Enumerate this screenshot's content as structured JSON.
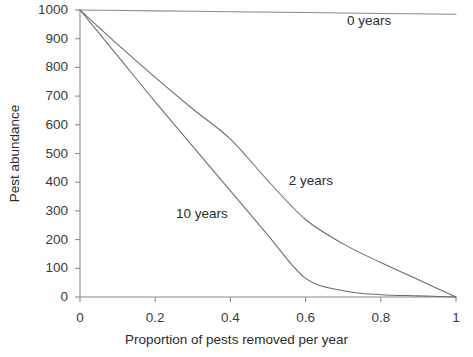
{
  "chart_data": {
    "type": "line",
    "title": "",
    "xlabel": "Proportion of pests removed per year",
    "ylabel": "Pest abundance",
    "xlim": [
      0,
      1
    ],
    "ylim": [
      0,
      1000
    ],
    "grid": false,
    "legend_position": "inline-annotations",
    "xticks": [
      "0",
      "0.2",
      "0.4",
      "0.6",
      "0.8",
      "1"
    ],
    "xtick_values": [
      0,
      0.2,
      0.4,
      0.6,
      0.8,
      1
    ],
    "yticks": [
      "0",
      "100",
      "200",
      "300",
      "400",
      "500",
      "600",
      "700",
      "800",
      "900",
      "1000"
    ],
    "ytick_values": [
      0,
      100,
      200,
      300,
      400,
      500,
      600,
      700,
      800,
      900,
      1000
    ],
    "series": [
      {
        "name": "0 years",
        "label": "0 years",
        "color": "#8c8c8c",
        "x": [
          0,
          0.2,
          0.4,
          0.6,
          0.8,
          1
        ],
        "values": [
          1000,
          997,
          994,
          991,
          988,
          985
        ]
      },
      {
        "name": "2 years",
        "label": "2 years",
        "color": "#6b6b6b",
        "x": [
          0,
          0.1,
          0.2,
          0.3,
          0.4,
          0.5,
          0.6,
          0.7,
          0.8,
          0.9,
          1
        ],
        "values": [
          1000,
          880,
          765,
          655,
          550,
          405,
          270,
          185,
          120,
          60,
          0
        ]
      },
      {
        "name": "10 years",
        "label": "10 years",
        "color": "#6b6b6b",
        "x": [
          0,
          0.1,
          0.2,
          0.3,
          0.4,
          0.5,
          0.6,
          0.7,
          0.8,
          0.9,
          1
        ],
        "values": [
          1000,
          840,
          680,
          525,
          370,
          215,
          65,
          22,
          8,
          4,
          0
        ]
      }
    ],
    "annotations": [
      {
        "text": "0 years",
        "x": 0.71,
        "y": 960
      },
      {
        "text": "2 years",
        "x": 0.555,
        "y": 405
      },
      {
        "text": "10 years",
        "x": 0.255,
        "y": 290
      }
    ]
  },
  "axes": {
    "axis_color": "#8a8a8a",
    "tick_color": "#8a8a8a"
  }
}
